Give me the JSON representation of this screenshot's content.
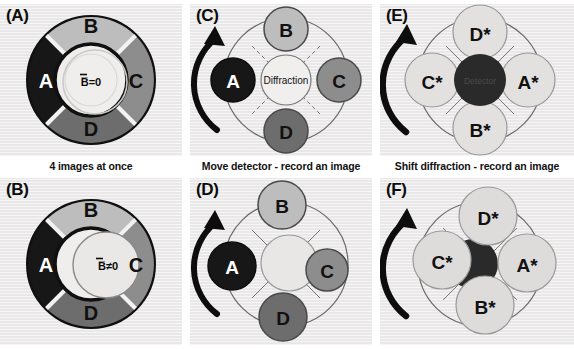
{
  "figure": {
    "background_color": "#ffffff",
    "panel_background_color": "#eceaea",
    "width": 574,
    "height": 349
  },
  "captions": {
    "column1": "4 images at once",
    "column2": "Move detector - record an image",
    "column3": "Shift diffraction - record an image"
  },
  "colors": {
    "segment_a": "#171717",
    "segment_b": "#bdbdbd",
    "segment_c": "#8d8d8d",
    "segment_d": "#6d6d6d",
    "detector_dark": "#2a2a2a",
    "pale_disc": "#dcdcdc",
    "outline": "#101010",
    "thin_outline": "#4a4a4a",
    "center_disc": "#e7e5e4",
    "arrow": "#0d0d0d"
  },
  "panels": [
    {
      "id": "A",
      "label": "(A)",
      "type": "annulus",
      "center_text": "B̅=0",
      "center_offset": false,
      "segments": [
        {
          "label": "A",
          "position": "left",
          "shade": "segment_a",
          "text_color": "#ffffff"
        },
        {
          "label": "B",
          "position": "top",
          "shade": "segment_b",
          "text_color": "#111111"
        },
        {
          "label": "C",
          "position": "right",
          "shade": "segment_c",
          "text_color": "#111111"
        },
        {
          "label": "D",
          "position": "bottom",
          "shade": "segment_d",
          "text_color": "#111111"
        }
      ]
    },
    {
      "id": "B",
      "label": "(B)",
      "type": "annulus",
      "center_text": "B̅≠0",
      "center_offset": true,
      "segments": [
        {
          "label": "A",
          "position": "left",
          "shade": "segment_a",
          "text_color": "#ffffff"
        },
        {
          "label": "B",
          "position": "top",
          "shade": "segment_b",
          "text_color": "#111111"
        },
        {
          "label": "C",
          "position": "right",
          "shade": "segment_c",
          "text_color": "#111111"
        },
        {
          "label": "D",
          "position": "bottom",
          "shade": "segment_d",
          "text_color": "#111111"
        }
      ]
    },
    {
      "id": "C",
      "label": "(C)",
      "type": "discs-dark",
      "center_text": "Diffraction",
      "center_offset": false,
      "arrow": true,
      "discs": [
        {
          "label": "A",
          "position": "left",
          "shade": "segment_a",
          "text_color": "#ffffff"
        },
        {
          "label": "B",
          "position": "top",
          "shade": "segment_b",
          "text_color": "#111111"
        },
        {
          "label": "C",
          "position": "right",
          "shade": "segment_c",
          "text_color": "#111111"
        },
        {
          "label": "D",
          "position": "bottom",
          "shade": "segment_d",
          "text_color": "#111111"
        }
      ]
    },
    {
      "id": "D",
      "label": "(D)",
      "type": "discs-dark",
      "center_text": "",
      "center_offset": true,
      "arrow": true,
      "discs": [
        {
          "label": "A",
          "position": "left",
          "shade": "segment_a",
          "text_color": "#ffffff"
        },
        {
          "label": "B",
          "position": "top",
          "shade": "segment_b",
          "text_color": "#111111"
        },
        {
          "label": "C",
          "position": "right",
          "shade": "segment_c",
          "text_color": "#111111"
        },
        {
          "label": "D",
          "position": "bottom",
          "shade": "segment_d",
          "text_color": "#111111"
        }
      ]
    },
    {
      "id": "E",
      "label": "(E)",
      "type": "discs-pale",
      "center_text": "Detector",
      "center_offset": false,
      "arrow": true,
      "discs": [
        {
          "label": "C*",
          "position": "left",
          "shade": "pale_disc",
          "text_color": "#111111"
        },
        {
          "label": "D*",
          "position": "top",
          "shade": "pale_disc",
          "text_color": "#111111"
        },
        {
          "label": "A*",
          "position": "right",
          "shade": "pale_disc",
          "text_color": "#111111"
        },
        {
          "label": "B*",
          "position": "bottom",
          "shade": "pale_disc",
          "text_color": "#111111"
        }
      ]
    },
    {
      "id": "F",
      "label": "(F)",
      "type": "discs-pale",
      "center_text": "",
      "center_offset": true,
      "arrow": true,
      "discs": [
        {
          "label": "C*",
          "position": "left",
          "shade": "pale_disc",
          "text_color": "#111111"
        },
        {
          "label": "D*",
          "position": "top",
          "shade": "pale_disc",
          "text_color": "#111111"
        },
        {
          "label": "A*",
          "position": "right",
          "shade": "pale_disc",
          "text_color": "#111111"
        },
        {
          "label": "B*",
          "position": "bottom",
          "shade": "pale_disc",
          "text_color": "#111111"
        }
      ]
    }
  ]
}
